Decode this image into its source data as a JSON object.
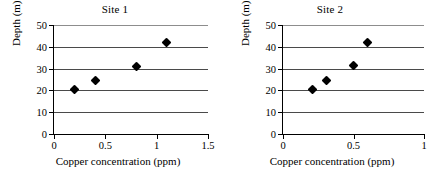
{
  "chart_data": [
    {
      "type": "scatter",
      "title": "Site 1",
      "xlabel": "Copper concentration (ppm)",
      "ylabel": "Depth (m)",
      "xlim": [
        0,
        1.5
      ],
      "ylim": [
        0,
        50
      ],
      "xticks": [
        "0",
        "0.5",
        "1",
        "1.5"
      ],
      "xtick_values": [
        0,
        0.5,
        1,
        1.5
      ],
      "yticks": [
        "0",
        "10",
        "20",
        "30",
        "40",
        "50"
      ],
      "ytick_values": [
        0,
        10,
        20,
        30,
        40,
        50
      ],
      "grid": "horizontal",
      "legend": "none",
      "marker": "filled-diamond",
      "points": [
        {
          "x": 0.2,
          "y": 20.2
        },
        {
          "x": 0.4,
          "y": 24.6
        },
        {
          "x": 0.8,
          "y": 31.1
        },
        {
          "x": 1.1,
          "y": 41.8
        }
      ]
    },
    {
      "type": "scatter",
      "title": "Site 2",
      "xlabel": "Copper concentration (ppm)",
      "ylabel": "Depth (m)",
      "xlim": [
        0,
        1
      ],
      "ylim": [
        0,
        50
      ],
      "xticks": [
        "0",
        "0.5",
        "1"
      ],
      "xtick_values": [
        0,
        0.5,
        1
      ],
      "yticks": [
        "0",
        "10",
        "20",
        "30",
        "40",
        "50"
      ],
      "ytick_values": [
        0,
        10,
        20,
        30,
        40,
        50
      ],
      "grid": "horizontal",
      "legend": "none",
      "marker": "filled-diamond",
      "points": [
        {
          "x": 0.21,
          "y": 20.2
        },
        {
          "x": 0.31,
          "y": 24.5
        },
        {
          "x": 0.5,
          "y": 31.2
        },
        {
          "x": 0.6,
          "y": 42.0
        }
      ]
    }
  ],
  "colors": {
    "marker": "#000000",
    "gridline": "#4a4a4a",
    "axis": "#000000",
    "background": "#ffffff"
  }
}
